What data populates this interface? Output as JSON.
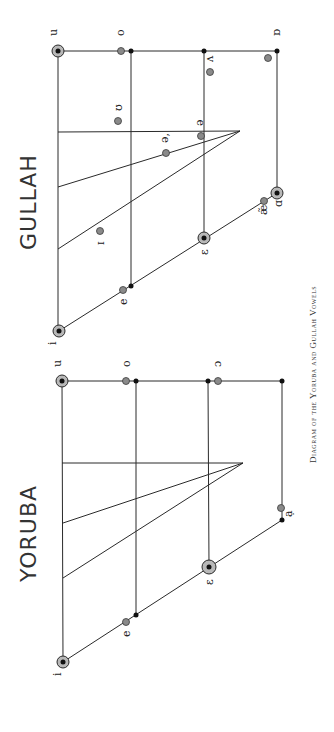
{
  "caption": "Diagram of the Yoruba and Gullah Vowels",
  "orientation": "rotated 90° counter-clockwise (text reads bottom-to-top)",
  "diagrams": [
    {
      "title": "GULLAH",
      "vowel_labels": {
        "i": "i",
        "e": "e",
        "epsilon": "ɛ",
        "ae": "æ̃",
        "a": "ɑ",
        "u": "u",
        "o": "o",
        "wedge": "ʌ",
        "open_o": "ɒ",
        "upsilon": "ʊ",
        "schwa": "ə",
        "schwa2": "ə,",
        "small_cap_i": "ɪ"
      }
    },
    {
      "title": "YORUBA",
      "vowel_labels": {
        "i": "i",
        "e": "e",
        "epsilon": "ɛ",
        "a": "ạ",
        "u": "u",
        "o": "o",
        "open_o": "ɔ"
      }
    }
  ],
  "legend": {
    "black_dot": "reference cardinal point",
    "gray_dot": "vowel position",
    "hatched_circle": "cardinal vowel"
  }
}
